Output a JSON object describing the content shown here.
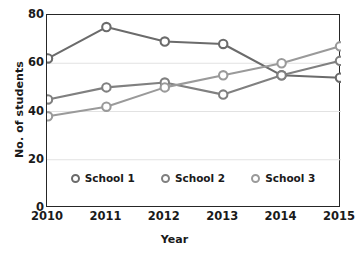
{
  "chart_data": {
    "type": "line",
    "title": "",
    "xlabel": "Year",
    "ylabel": "No. of students",
    "categories": [
      "2010",
      "2011",
      "2012",
      "2013",
      "2014",
      "2015"
    ],
    "x": [
      2010,
      2011,
      2012,
      2013,
      2014,
      2015
    ],
    "ylim": [
      0,
      80
    ],
    "yticks": [
      "0",
      "20",
      "40",
      "60",
      "80"
    ],
    "ytick_values": [
      0,
      20,
      40,
      60,
      80
    ],
    "grid": "horizontal-light",
    "legend_position": "inside-bottom-center",
    "series": [
      {
        "name": "School 1",
        "color": "#6b6b6b",
        "values": [
          62,
          75,
          69,
          68,
          55,
          54
        ]
      },
      {
        "name": "School 2",
        "color": "#808080",
        "values": [
          45,
          50,
          52,
          47,
          55,
          61
        ]
      },
      {
        "name": "School 3",
        "color": "#9a9a9a",
        "values": [
          38,
          42,
          50,
          55,
          60,
          67
        ]
      }
    ]
  },
  "legend": {
    "items": [
      {
        "label": "School 1",
        "color": "#6b6b6b"
      },
      {
        "label": "School 2",
        "color": "#808080"
      },
      {
        "label": "School 3",
        "color": "#9a9a9a"
      }
    ]
  },
  "axes": {
    "x_title": "Year",
    "y_title": "No. of students"
  },
  "colors": {
    "axis": "#262626",
    "grid": "#e2e2e2",
    "text": "#1a1a1a",
    "background": "#ffffff"
  }
}
